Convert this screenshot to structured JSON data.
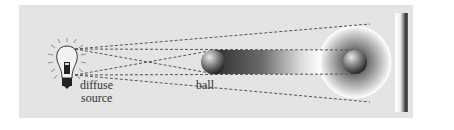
{
  "diagram": {
    "labels": {
      "source_line1": "diffuse",
      "source_line2": "source",
      "ball": "ball"
    },
    "elements": {
      "source": "light-bulb-icon",
      "occluder": "ball",
      "shadow": "penumbra-gradient",
      "screen": "vertical-screen"
    },
    "colors": {
      "panel": "#e4e4e4",
      "dash": "#555555",
      "ball_light": "#d9d9d9",
      "ball_dark": "#2a2a2a",
      "beam_dark": "#333333",
      "halo_edge": "#ffffff"
    }
  }
}
